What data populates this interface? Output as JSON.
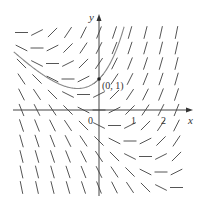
{
  "figure": {
    "type": "slope-field",
    "equation": "y' = x + y",
    "axis_labels": {
      "x": "x",
      "y": "y"
    },
    "tick_labels": {
      "origin": "0",
      "x1": "1",
      "x2": "2"
    },
    "point_label": "(0, 1)",
    "point": {
      "x": 0,
      "y": 1
    },
    "solution_curve": "y = 2e^x - x - 1",
    "grid": {
      "x_values": [
        -2.5,
        -2,
        -1.5,
        -1,
        -0.5,
        0,
        0.5,
        1,
        1.5,
        2,
        2.5
      ],
      "y_values": [
        2.5,
        2,
        1.5,
        1,
        0.5,
        0,
        -0.5,
        -1,
        -1.5,
        -2,
        -2.5
      ]
    },
    "colors": {
      "ink": "#555555",
      "curve": "#888888",
      "axis": "#444444",
      "point": "#222222"
    }
  }
}
